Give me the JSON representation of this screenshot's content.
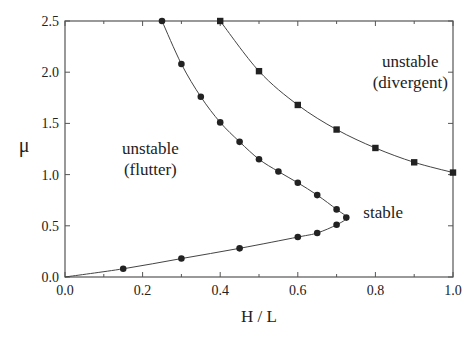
{
  "chart_data": {
    "type": "line",
    "title": "",
    "xlabel": "H / L",
    "ylabel": "μ",
    "xlim": [
      0,
      1.0
    ],
    "ylim": [
      0,
      2.5
    ],
    "xticks": [
      "0.0",
      "0.2",
      "0.4",
      "0.6",
      "0.8",
      "1.0"
    ],
    "yticks": [
      "0.0",
      "0.5",
      "1.0",
      "1.5",
      "2.0",
      "2.5"
    ],
    "grid": false,
    "legend": null,
    "series": [
      {
        "name": "flutter boundary",
        "marker": "circle",
        "x": [
          0.0,
          0.15,
          0.3,
          0.45,
          0.6,
          0.65,
          0.7,
          0.725,
          0.7,
          0.65,
          0.6,
          0.55,
          0.5,
          0.45,
          0.4,
          0.35,
          0.3,
          0.25
        ],
        "y": [
          0.0,
          0.08,
          0.18,
          0.28,
          0.39,
          0.43,
          0.51,
          0.58,
          0.66,
          0.8,
          0.92,
          1.03,
          1.15,
          1.32,
          1.51,
          1.76,
          2.08,
          2.5
        ]
      },
      {
        "name": "divergence boundary",
        "marker": "square",
        "x": [
          0.4,
          0.5,
          0.6,
          0.7,
          0.8,
          0.9,
          1.0
        ],
        "y": [
          2.5,
          2.01,
          1.68,
          1.44,
          1.26,
          1.12,
          1.02
        ]
      }
    ],
    "annotations": [
      {
        "lines": [
          "unstable",
          "(flutter)"
        ],
        "x": 0.22,
        "y": 1.2
      },
      {
        "lines": [
          "unstable",
          "(divergent)"
        ],
        "x": 0.89,
        "y": 2.05
      },
      {
        "lines": [
          "stable"
        ],
        "x": 0.82,
        "y": 0.58
      }
    ]
  }
}
